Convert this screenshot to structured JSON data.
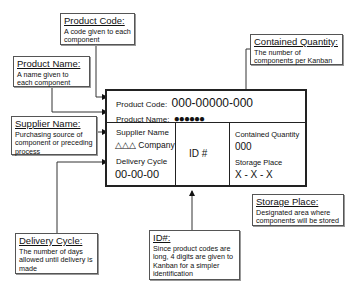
{
  "diagram": {
    "kanban_card": {
      "product_code_label": "Product Code:",
      "product_code_value": "000-00000-000",
      "product_name_label": "Product Name:",
      "product_name_value": "●●●●●●",
      "supplier_name_label": "Supplier Name",
      "supplier_name_value": "△△△ Company",
      "delivery_cycle_label": "Delivery Cycle",
      "delivery_cycle_value": "00-00-00",
      "id_label": "ID #",
      "contained_quantity_label": "Contained Quantity",
      "contained_quantity_value": "000",
      "storage_place_label": "Storage Place",
      "storage_place_value": "X - X - X"
    },
    "callouts": {
      "product_code": {
        "title": "Product Code:",
        "desc": "A code given to each component"
      },
      "product_name": {
        "title": "Product Name:",
        "desc": "A name given to each component"
      },
      "supplier_name": {
        "title": "Supplier Name:",
        "desc": "Purchasing source of component or preceding process"
      },
      "contained_quantity": {
        "title": "Contained Quantity:",
        "desc": "The number of components per Kanban"
      },
      "storage_place": {
        "title": "Storage Place:",
        "desc": "Designated area where components will be stored"
      },
      "delivery_cycle": {
        "title": "Delivery Cycle:",
        "desc": "The number of days allowed until delivery is made"
      },
      "id": {
        "title": "ID#:",
        "desc": "Since product codes are long, 4 digits are given to Kanban for a simpler identification"
      }
    }
  }
}
